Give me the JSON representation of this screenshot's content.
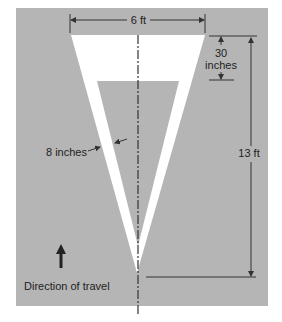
{
  "diagram": {
    "colors": {
      "pavement": "#b5b5b5",
      "marking": "#ffffff",
      "lines": "#333333",
      "background": "#ffffff"
    },
    "labels": {
      "width": "6 ft",
      "top_band_value": "30",
      "top_band_unit": "inches",
      "stroke_width": "8 inches",
      "height": "13 ft",
      "direction": "Direction of travel"
    },
    "icons": {
      "direction_arrow": "arrow-up-icon"
    }
  }
}
